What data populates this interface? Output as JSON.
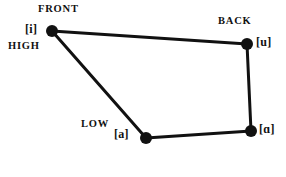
{
  "diagram": {
    "background_color": "#ffffff",
    "stroke_color": "#111111",
    "line_width": 3,
    "dot_radius": 6,
    "axis_labels": [
      {
        "id": "front",
        "text": "FRONT",
        "x": 38,
        "y": 4
      },
      {
        "id": "back",
        "text": "BACK",
        "x": 218,
        "y": 16
      },
      {
        "id": "high",
        "text": "HIGH",
        "x": 8,
        "y": 41
      },
      {
        "id": "low",
        "text": "LOW",
        "x": 81,
        "y": 119
      }
    ],
    "vertices": [
      {
        "id": "i",
        "label": "[i]",
        "x": 52,
        "y": 31,
        "label_x": 25,
        "label_y": 23
      },
      {
        "id": "u",
        "label": "[u]",
        "x": 247,
        "y": 44,
        "label_x": 256,
        "label_y": 36
      },
      {
        "id": "a",
        "label": "[a]",
        "x": 146,
        "y": 138,
        "label_x": 114,
        "label_y": 128
      },
      {
        "id": "alpha",
        "label": "[ɑ]",
        "x": 251,
        "y": 131,
        "label_x": 259,
        "label_y": 123
      }
    ],
    "edges": [
      {
        "id": "i-u",
        "from": "i",
        "to": "u"
      },
      {
        "id": "u-alpha",
        "from": "u",
        "to": "alpha"
      },
      {
        "id": "alpha-a",
        "from": "alpha",
        "to": "a"
      },
      {
        "id": "a-i",
        "from": "a",
        "to": "i"
      }
    ]
  }
}
